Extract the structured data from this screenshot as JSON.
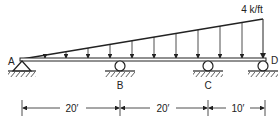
{
  "diagram": {
    "type": "continuous-beam",
    "load": {
      "label": "4 k/ft",
      "kind": "triangular distributed load",
      "max_intensity": "4 k/ft",
      "max_at": "D",
      "zero_at": "A"
    },
    "supports": [
      {
        "name": "A",
        "kind": "pin"
      },
      {
        "name": "B",
        "kind": "roller"
      },
      {
        "name": "C",
        "kind": "roller"
      },
      {
        "name": "D",
        "kind": "roller"
      }
    ],
    "spans": [
      {
        "from": "A",
        "to": "B",
        "label": "20′"
      },
      {
        "from": "B",
        "to": "C",
        "label": "20′"
      },
      {
        "from": "C",
        "to": "D",
        "label": "10′"
      }
    ]
  },
  "labels": {
    "A": "A",
    "B": "B",
    "C": "C",
    "D": "D",
    "load": "4 k/ft",
    "span_ab": "20′",
    "span_bc": "20′",
    "span_cd": "10′"
  },
  "colors": {
    "ink": "#222222",
    "background": "#ffffff"
  }
}
